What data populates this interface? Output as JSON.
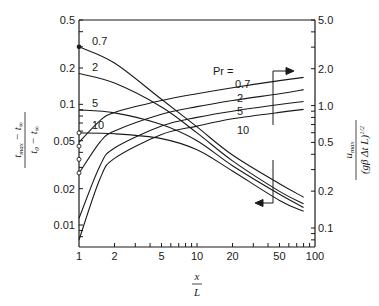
{
  "chart_data": {
    "type": "line",
    "title": "",
    "xlabel": "x / L",
    "ylabel_left": "(t_max − t_∞) / (t_0 − t_∞)",
    "ylabel_right": "u_max / (gβ Δt L)^1/2",
    "xscale": "log",
    "yscale_left": "log",
    "yscale_right": "log",
    "xlim": [
      1,
      100
    ],
    "ylim_left": [
      0.007,
      0.5
    ],
    "ylim_right": [
      0.07,
      5.0
    ],
    "x_ticks": [
      1,
      2,
      5,
      10,
      20,
      50,
      100
    ],
    "x_tick_labels": [
      "1",
      "2",
      "5",
      "10",
      "20",
      "50",
      "100"
    ],
    "y_left_ticks": [
      0.5,
      0.2,
      0.1,
      0.05,
      0.02,
      0.01
    ],
    "y_left_tick_labels": [
      "0.5",
      "0.2",
      "0.1",
      "0.05",
      "0.02",
      "0.01"
    ],
    "y_right_ticks": [
      5.0,
      2.0,
      1.0,
      0.5,
      0.2,
      0.1
    ],
    "y_right_tick_labels": [
      "5.0",
      "2.0",
      "1.0",
      "0.5",
      "0.2",
      "0.1"
    ],
    "grid": false,
    "legend_title": "Pr =",
    "legend_entries": [
      "0.7",
      "2",
      "5",
      "10"
    ],
    "annotations": [
      {
        "text": "arrow pointing right: rising curves read on right axis"
      },
      {
        "text": "arrow pointing left: falling curves read on left axis"
      }
    ],
    "series": [
      {
        "name": "temperature Pr=0.7",
        "axis": "left",
        "x": [
          1,
          2,
          5,
          10,
          20,
          50,
          80
        ],
        "values": [
          0.3,
          0.22,
          0.11,
          0.065,
          0.038,
          0.022,
          0.017
        ]
      },
      {
        "name": "temperature Pr=2",
        "axis": "left",
        "x": [
          1,
          2,
          5,
          10,
          20,
          50,
          80
        ],
        "values": [
          0.18,
          0.15,
          0.095,
          0.058,
          0.034,
          0.019,
          0.015
        ]
      },
      {
        "name": "temperature Pr=5",
        "axis": "left",
        "x": [
          1,
          2,
          5,
          10,
          20,
          50,
          80
        ],
        "values": [
          0.09,
          0.085,
          0.068,
          0.05,
          0.031,
          0.018,
          0.014
        ]
      },
      {
        "name": "temperature Pr=10",
        "axis": "left",
        "x": [
          1,
          2,
          5,
          10,
          20,
          50,
          80
        ],
        "values": [
          0.058,
          0.057,
          0.052,
          0.042,
          0.028,
          0.016,
          0.013
        ]
      },
      {
        "name": "velocity Pr=0.7",
        "axis": "right",
        "x": [
          1,
          1.5,
          2,
          5,
          10,
          20,
          50,
          80
        ],
        "values": [
          0.5,
          0.75,
          0.88,
          1.1,
          1.25,
          1.4,
          1.6,
          1.7
        ]
      },
      {
        "name": "velocity Pr=2",
        "axis": "right",
        "x": [
          1,
          1.5,
          2,
          5,
          10,
          20,
          50,
          80
        ],
        "values": [
          0.28,
          0.5,
          0.62,
          0.85,
          0.98,
          1.1,
          1.25,
          1.35
        ]
      },
      {
        "name": "velocity Pr=5",
        "axis": "right",
        "x": [
          1,
          1.5,
          2,
          5,
          10,
          20,
          50,
          80
        ],
        "values": [
          0.12,
          0.32,
          0.45,
          0.68,
          0.8,
          0.9,
          1.02,
          1.08
        ]
      },
      {
        "name": "velocity Pr=10",
        "axis": "right",
        "x": [
          1,
          1.5,
          2,
          5,
          10,
          20,
          50,
          80
        ],
        "values": [
          0.08,
          0.25,
          0.37,
          0.58,
          0.68,
          0.78,
          0.88,
          0.93
        ]
      }
    ],
    "colors": {
      "line": "#1a1a1a",
      "background": "#ffffff"
    }
  }
}
